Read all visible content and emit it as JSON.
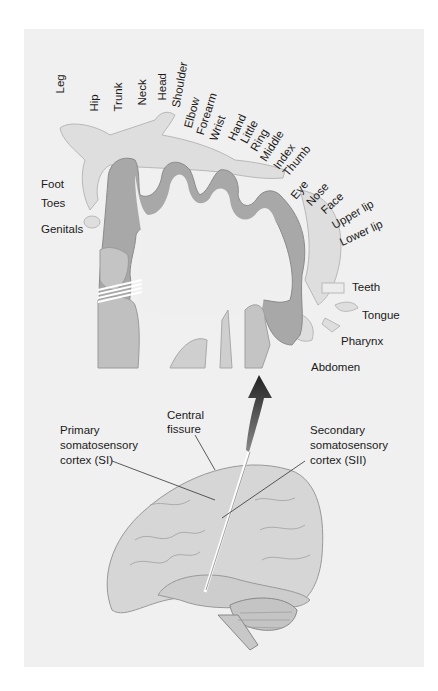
{
  "figure": {
    "colors": {
      "panel_bg": "#f0f0f0",
      "cortex_gray": "#a8a8a8",
      "cortex_light": "#c4c4c4",
      "white_matter": "#efefef",
      "homunculus": "#dcdcdc",
      "arrow": "#2a2a2a",
      "brain": "#d2d2d2",
      "text": "#1a1a1a"
    }
  },
  "body_map_labels": [
    {
      "id": "leg",
      "text": "Leg"
    },
    {
      "id": "hip",
      "text": "Hip"
    },
    {
      "id": "trunk",
      "text": "Trunk"
    },
    {
      "id": "neck",
      "text": "Neck"
    },
    {
      "id": "head",
      "text": "Head"
    },
    {
      "id": "shoulder",
      "text": "Shoulder"
    },
    {
      "id": "elbow",
      "text": "Elbow"
    },
    {
      "id": "forearm",
      "text": "Forearm"
    },
    {
      "id": "wrist",
      "text": "Wrist"
    },
    {
      "id": "hand",
      "text": "Hand"
    },
    {
      "id": "little",
      "text": "Little"
    },
    {
      "id": "ring",
      "text": "Ring"
    },
    {
      "id": "middle",
      "text": "Middle"
    },
    {
      "id": "index",
      "text": "Index"
    },
    {
      "id": "thumb",
      "text": "Thumb"
    },
    {
      "id": "eye",
      "text": "Eye"
    },
    {
      "id": "nose",
      "text": "Nose"
    },
    {
      "id": "face",
      "text": "Face"
    },
    {
      "id": "upper_lip",
      "text": "Upper lip"
    },
    {
      "id": "lower_lip",
      "text": "Lower lip"
    },
    {
      "id": "foot",
      "text": "Foot"
    },
    {
      "id": "toes",
      "text": "Toes"
    },
    {
      "id": "genitals",
      "text": "Genitals"
    },
    {
      "id": "teeth",
      "text": "Teeth"
    },
    {
      "id": "tongue",
      "text": "Tongue"
    },
    {
      "id": "pharynx",
      "text": "Pharynx"
    },
    {
      "id": "abdomen",
      "text": "Abdomen"
    }
  ],
  "brain_labels": {
    "central_fissure": [
      "Central",
      "fissure"
    ],
    "primary": [
      "Primary",
      "somatosensory",
      "cortex (SI)"
    ],
    "secondary": [
      "Secondary",
      "somatosensory",
      "cortex (SII)"
    ]
  }
}
